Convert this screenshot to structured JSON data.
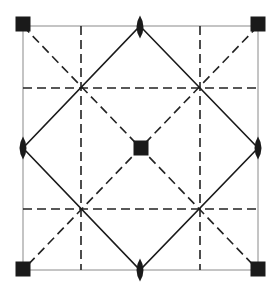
{
  "diagram": {
    "canvas": {
      "width": 277,
      "height": 293
    },
    "frame": {
      "x1": 23,
      "y1": 26,
      "x2": 258,
      "y2": 270,
      "color": "#8a8a8a",
      "width": 1
    },
    "colors": {
      "ink": "#1a1a1a",
      "dash": "#222222",
      "frame": "#8a8a8a",
      "background": "#ffffff"
    },
    "dash_pattern": "9 5",
    "mirror_lines_dashed": {
      "vertical_x": [
        81,
        200
      ],
      "horizontal_y": [
        88,
        209
      ]
    },
    "diagonals_dashed": [
      {
        "from": [
          23,
          26
        ],
        "to": [
          258,
          270
        ]
      },
      {
        "from": [
          258,
          26
        ],
        "to": [
          23,
          270
        ]
      }
    ],
    "diamond_solid": {
      "points": [
        [
          140,
          26
        ],
        [
          258,
          148
        ],
        [
          140,
          270
        ],
        [
          23,
          148
        ]
      ]
    },
    "fourfold_axes_squares": [
      {
        "name": "corner-top-left",
        "cx": 23,
        "cy": 24
      },
      {
        "name": "corner-top-right",
        "cx": 258,
        "cy": 24
      },
      {
        "name": "corner-bottom-left",
        "cx": 23,
        "cy": 269
      },
      {
        "name": "corner-bottom-right",
        "cx": 258,
        "cy": 269
      },
      {
        "name": "center",
        "cx": 141,
        "cy": 148
      }
    ],
    "square_size": 15,
    "twofold_axes_lenses": [
      {
        "name": "edge-top",
        "cx": 140,
        "cy": 27
      },
      {
        "name": "edge-bottom",
        "cx": 140,
        "cy": 270
      },
      {
        "name": "edge-left",
        "cx": 23,
        "cy": 148
      },
      {
        "name": "edge-right",
        "cx": 258,
        "cy": 148
      }
    ],
    "lens_size": {
      "rx": 3.5,
      "ry": 11.5
    }
  }
}
